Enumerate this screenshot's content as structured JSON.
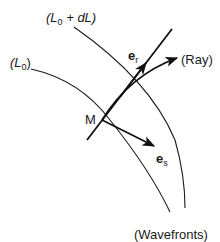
{
  "diagram": {
    "labels": {
      "wavefront_outer": "(L",
      "wavefront_outer_sub": "0",
      "wavefront_outer_tail": " + dL)",
      "wavefront_inner": "(L",
      "wavefront_inner_sub": "0",
      "wavefront_inner_tail": ")",
      "point": "M",
      "vector_r": "e",
      "vector_r_sub": "r",
      "vector_s": "e",
      "vector_s_sub": "s",
      "ray": "(Ray)",
      "wavefronts": "(Wavefronts)"
    },
    "colors": {
      "stroke": "#1a1a1a",
      "background": "#ffffff"
    }
  }
}
